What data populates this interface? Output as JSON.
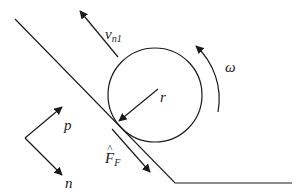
{
  "diagram": {
    "labels": {
      "velocity": "v",
      "velocity_sub": "n1",
      "omega": "ω",
      "radius": "r",
      "axis_p": "p",
      "axis_n": "n",
      "force": "F",
      "force_hat": "^",
      "force_sub": "F"
    },
    "colors": {
      "line": "#1a1a1a",
      "background": "#ffffff"
    }
  }
}
